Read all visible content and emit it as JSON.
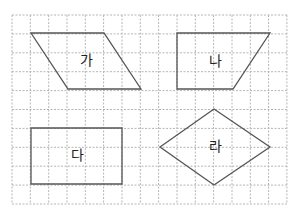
{
  "figure": {
    "grid": {
      "left": 12,
      "top": 15,
      "cols": 15,
      "rows": 10,
      "cell_w": 18.33,
      "cell_h": 18.9,
      "color": "#b5b5b5"
    },
    "stroke_color": "#555555",
    "shapes": [
      {
        "label": "가",
        "type": "parallelogram",
        "points": "31,33 104,33 141,89 68,89",
        "label_pos": [
          86,
          61
        ]
      },
      {
        "label": "나",
        "type": "trapezoid",
        "points": "177,33 270,33 233,89 177,89",
        "label_pos": [
          215,
          62
        ]
      },
      {
        "label": "다",
        "type": "rectangle",
        "points": "31,128 122,128 122,184 31,184",
        "label_pos": [
          77,
          156
        ]
      },
      {
        "label": "라",
        "type": "rhombus",
        "points": "160,147 214,109 270,147 214,185",
        "label_pos": [
          215,
          147
        ]
      }
    ]
  }
}
